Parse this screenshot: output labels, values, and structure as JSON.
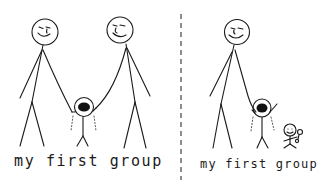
{
  "comic": {
    "panels": [
      {
        "id": "left",
        "caption": "my first group",
        "figures": [
          "smiling adult (left)",
          "crying child held by both hands",
          "smiling adult (right)"
        ]
      },
      {
        "id": "right",
        "caption": "my first group",
        "figures": [
          "smiling adult",
          "crying child with arms raised",
          "smiling baby with rattle"
        ]
      }
    ],
    "divider": "dashed vertical line",
    "colors": {
      "ink": "#1a1a1a",
      "background": "#ffffff"
    }
  }
}
